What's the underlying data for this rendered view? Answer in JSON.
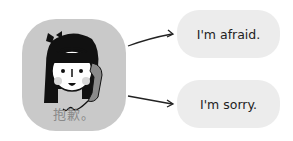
{
  "portrait": {
    "caption": "抱歉。",
    "bg_color": "#c9c9c9",
    "illustration": "girl-on-phone-icon"
  },
  "options": [
    {
      "label": "I'm afraid."
    },
    {
      "label": "I'm sorry."
    }
  ]
}
